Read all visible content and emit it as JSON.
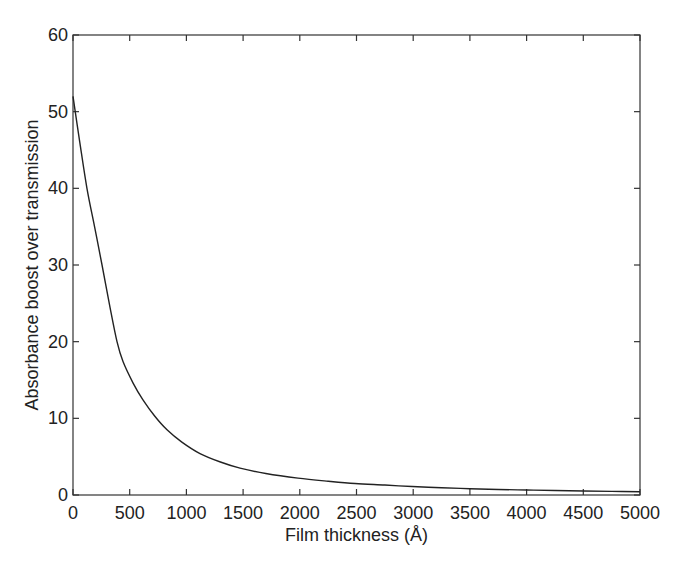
{
  "chart_data": {
    "type": "line",
    "title": "",
    "xlabel": "Film thickness (Å)",
    "ylabel": "Absorbance boost over transmission",
    "xlim": [
      0,
      5000
    ],
    "ylim": [
      0,
      60
    ],
    "xticks": [
      0,
      500,
      1000,
      1500,
      2000,
      2500,
      3000,
      3500,
      4000,
      4500,
      5000
    ],
    "yticks": [
      0,
      10,
      20,
      30,
      40,
      50,
      60
    ],
    "xtick_labels": [
      "0",
      "500",
      "1000",
      "1500",
      "2000",
      "2500",
      "3000",
      "3500",
      "4000",
      "4500",
      "5000"
    ],
    "ytick_labels": [
      "0",
      "10",
      "20",
      "30",
      "40",
      "50",
      "60"
    ],
    "grid": false,
    "legend": null,
    "series": [
      {
        "name": "Absorbance boost",
        "color": "#222222",
        "x": [
          0,
          60,
          123,
          190,
          256,
          326,
          388,
          441,
          530,
          617,
          720,
          829,
          960,
          1120,
          1300,
          1473,
          1700,
          1984,
          2250,
          2487,
          2750,
          2990,
          3250,
          3500,
          3750,
          4000,
          4250,
          4500,
          4750,
          5000
        ],
        "y": [
          52,
          46,
          40,
          35,
          30,
          24.5,
          20,
          17.4,
          14.6,
          12.4,
          10.3,
          8.5,
          6.9,
          5.4,
          4.3,
          3.5,
          2.8,
          2.2,
          1.8,
          1.5,
          1.3,
          1.1,
          0.95,
          0.82,
          0.72,
          0.65,
          0.58,
          0.52,
          0.47,
          0.43
        ]
      }
    ]
  }
}
